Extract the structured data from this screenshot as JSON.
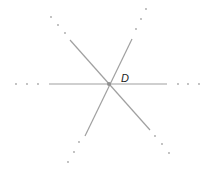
{
  "diagram": {
    "point": {
      "label": "D",
      "x": 109,
      "y": 84
    },
    "label_position": {
      "x": 121,
      "y": 82
    },
    "colors": {
      "line": "#a0a0a0",
      "dot": "#a8a8a8",
      "point": "#909090",
      "label": "#222222"
    },
    "lines": [
      {
        "name": "horizontal-line",
        "x1": 49,
        "y1": 84,
        "x2": 167,
        "y2": 84,
        "dots": [
          [
            16,
            84
          ],
          [
            27,
            84
          ],
          [
            38,
            84
          ],
          [
            178,
            84
          ],
          [
            188,
            84
          ],
          [
            199,
            84
          ]
        ]
      },
      {
        "name": "descending-line",
        "x1": 70,
        "y1": 40,
        "x2": 150,
        "y2": 130,
        "dots": [
          [
            51,
            17
          ],
          [
            58,
            25
          ],
          [
            65,
            33
          ],
          [
            155,
            136
          ],
          [
            162,
            144
          ],
          [
            169,
            153
          ]
        ]
      },
      {
        "name": "ascending-line",
        "x1": 132,
        "y1": 39,
        "x2": 85,
        "y2": 136,
        "dots": [
          [
            136,
            29
          ],
          [
            141,
            19
          ],
          [
            146,
            9
          ],
          [
            79,
            142
          ],
          [
            74,
            152
          ],
          [
            68,
            162
          ]
        ]
      }
    ]
  }
}
